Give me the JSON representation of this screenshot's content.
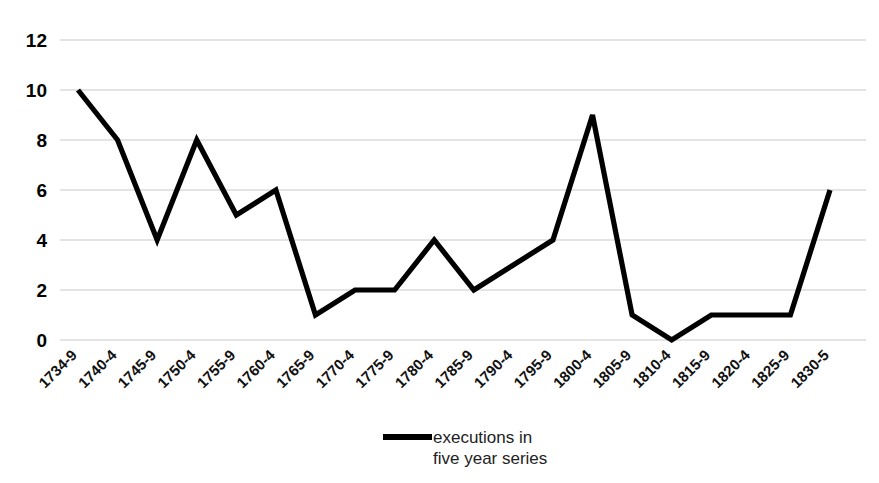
{
  "chart_data": {
    "type": "line",
    "title": "",
    "xlabel": "",
    "ylabel": "",
    "ylim": [
      0,
      12
    ],
    "yticks": [
      0,
      2,
      4,
      6,
      8,
      10,
      12
    ],
    "grid": true,
    "legend_position": "bottom-center",
    "categories": [
      "1734-9",
      "1740-4",
      "1745-9",
      "1750-4",
      "1755-9",
      "1760-4",
      "1765-9",
      "1770-4",
      "1775-9",
      "1780-4",
      "1785-9",
      "1790-4",
      "1795-9",
      "1800-4",
      "1805-9",
      "1810-4",
      "1815-9",
      "1820-4",
      "1825-9",
      "1830-5"
    ],
    "series": [
      {
        "name": "executions in five year series",
        "color": "#000000",
        "values": [
          10,
          8,
          4,
          8,
          5,
          6,
          1,
          2,
          2,
          4,
          2,
          3,
          4,
          9,
          1,
          0,
          1,
          1,
          1,
          6
        ]
      }
    ]
  },
  "legend": {
    "entries": [
      {
        "label_line1": "executions in",
        "label_line2": "five year series",
        "color": "#000000"
      }
    ]
  },
  "style": {
    "background": "#ffffff",
    "gridline_color": "#c9c9c9",
    "line_color": "#000000",
    "tick_text_color": "#000000"
  }
}
